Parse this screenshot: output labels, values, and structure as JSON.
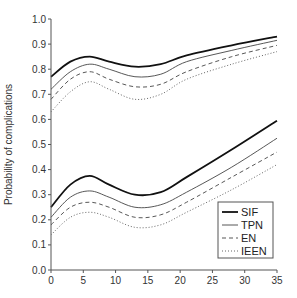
{
  "chart_data": {
    "type": "line",
    "title": "",
    "xlabel": "",
    "ylabel": "Probability of complications",
    "xlim": [
      0,
      35
    ],
    "ylim": [
      0.0,
      1.0
    ],
    "xticks": [
      "0",
      "5",
      "10",
      "15",
      "20",
      "25",
      "30",
      "35"
    ],
    "xtick_values": [
      0,
      5,
      10,
      15,
      20,
      25,
      30,
      35
    ],
    "yticks": [
      "0.0",
      "0.1",
      "0.2",
      "0.3",
      "0.4",
      "0.5",
      "0.6",
      "0.7",
      "0.8",
      "0.9",
      "1.0"
    ],
    "ytick_values": [
      0.0,
      0.1,
      0.2,
      0.3,
      0.4,
      0.5,
      0.6,
      0.7,
      0.8,
      0.9,
      1.0
    ],
    "grid": false,
    "legend_position": "bottom-right",
    "x": [
      0,
      3,
      6,
      9,
      13,
      17,
      21,
      28,
      35
    ],
    "series": [
      {
        "name": "SIF",
        "group": "upper",
        "style": "solid-thick",
        "values": [
          0.77,
          0.83,
          0.85,
          0.83,
          0.81,
          0.82,
          0.855,
          0.895,
          0.93
        ]
      },
      {
        "name": "TPN",
        "group": "upper",
        "style": "solid-thin",
        "values": [
          0.72,
          0.79,
          0.82,
          0.8,
          0.77,
          0.78,
          0.83,
          0.875,
          0.915
        ]
      },
      {
        "name": "EN",
        "group": "upper",
        "style": "dashed",
        "values": [
          0.68,
          0.76,
          0.79,
          0.76,
          0.73,
          0.74,
          0.79,
          0.85,
          0.895
        ]
      },
      {
        "name": "IEEN",
        "group": "upper",
        "style": "dotted",
        "values": [
          0.63,
          0.71,
          0.75,
          0.72,
          0.68,
          0.7,
          0.76,
          0.82,
          0.87
        ]
      },
      {
        "name": "SIF",
        "group": "lower",
        "style": "solid-thick",
        "values": [
          0.25,
          0.34,
          0.375,
          0.34,
          0.3,
          0.31,
          0.37,
          0.48,
          0.595
        ]
      },
      {
        "name": "TPN",
        "group": "lower",
        "style": "solid-thin",
        "values": [
          0.21,
          0.29,
          0.315,
          0.29,
          0.25,
          0.26,
          0.31,
          0.41,
          0.525
        ]
      },
      {
        "name": "EN",
        "group": "lower",
        "style": "dashed",
        "values": [
          0.18,
          0.25,
          0.27,
          0.25,
          0.21,
          0.22,
          0.27,
          0.37,
          0.47
        ]
      },
      {
        "name": "IEEN",
        "group": "lower",
        "style": "dotted",
        "values": [
          0.14,
          0.21,
          0.23,
          0.21,
          0.17,
          0.18,
          0.23,
          0.32,
          0.42
        ]
      }
    ],
    "legend": [
      {
        "label": "SIF",
        "style": "solid-thick"
      },
      {
        "label": "TPN",
        "style": "solid-thin"
      },
      {
        "label": "EN",
        "style": "dashed"
      },
      {
        "label": "IEEN",
        "style": "dotted"
      }
    ]
  }
}
